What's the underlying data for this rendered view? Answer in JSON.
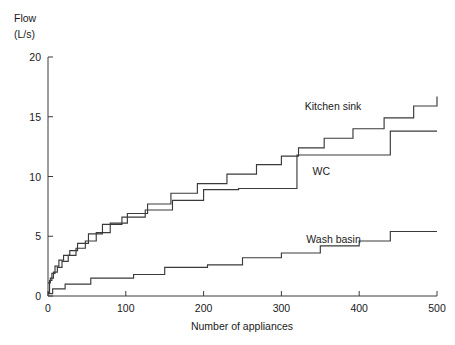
{
  "chart_data": {
    "type": "line",
    "title": "",
    "xlabel": "Number of appliances",
    "ylabel": "Flow",
    "ylabel_line1": "Flow",
    "ylabel_line2": "(L/s)",
    "yunit": "L/s",
    "xlim": [
      0,
      500
    ],
    "ylim": [
      0,
      20
    ],
    "xticks": [
      0,
      100,
      200,
      300,
      400,
      500
    ],
    "yticks": [
      0,
      5,
      10,
      15,
      20
    ],
    "xtick_labels": [
      "0",
      "100",
      "200",
      "300",
      "400",
      "500"
    ],
    "ytick_labels": [
      "0",
      "5",
      "10",
      "15",
      "20"
    ],
    "grid": false,
    "legend_position": "inline-annotations",
    "step_type": "post",
    "series": [
      {
        "name": "Kitchen sink",
        "label": "Kitchen sink",
        "label_x": 330,
        "label_y": 15.6,
        "x": [
          0,
          3,
          7,
          12,
          18,
          26,
          36,
          48,
          62,
          80,
          102,
          128,
          158,
          192,
          230,
          268,
          300,
          322,
          355,
          392,
          432,
          470,
          500
        ],
        "y": [
          1.1,
          1.5,
          2.0,
          2.4,
          2.9,
          3.4,
          4.0,
          4.6,
          5.3,
          6.1,
          6.9,
          7.7,
          8.6,
          9.4,
          10.2,
          11.0,
          11.7,
          12.4,
          13.2,
          14.0,
          14.9,
          15.9,
          16.7
        ]
      },
      {
        "name": "WC",
        "label": "WC",
        "label_x": 340,
        "label_y": 10.1,
        "x": [
          0,
          2,
          5,
          9,
          14,
          20,
          28,
          38,
          52,
          70,
          95,
          125,
          160,
          200,
          245,
          290,
          320,
          440,
          500
        ],
        "y": [
          0.3,
          1.3,
          1.9,
          2.5,
          3.0,
          3.4,
          3.8,
          4.4,
          5.2,
          6.0,
          6.6,
          7.2,
          8.0,
          8.9,
          9.0,
          9.0,
          11.8,
          13.8,
          13.8
        ]
      },
      {
        "name": "Wash basin",
        "label": "Wash basin",
        "label_x": 332,
        "label_y": 4.4,
        "x": [
          0,
          6,
          22,
          55,
          110,
          150,
          205,
          250,
          300,
          350,
          400,
          440,
          500
        ],
        "y": [
          0.2,
          0.6,
          1.0,
          1.5,
          1.8,
          2.4,
          2.6,
          3.2,
          3.6,
          4.2,
          4.6,
          5.4,
          5.4
        ]
      }
    ]
  }
}
